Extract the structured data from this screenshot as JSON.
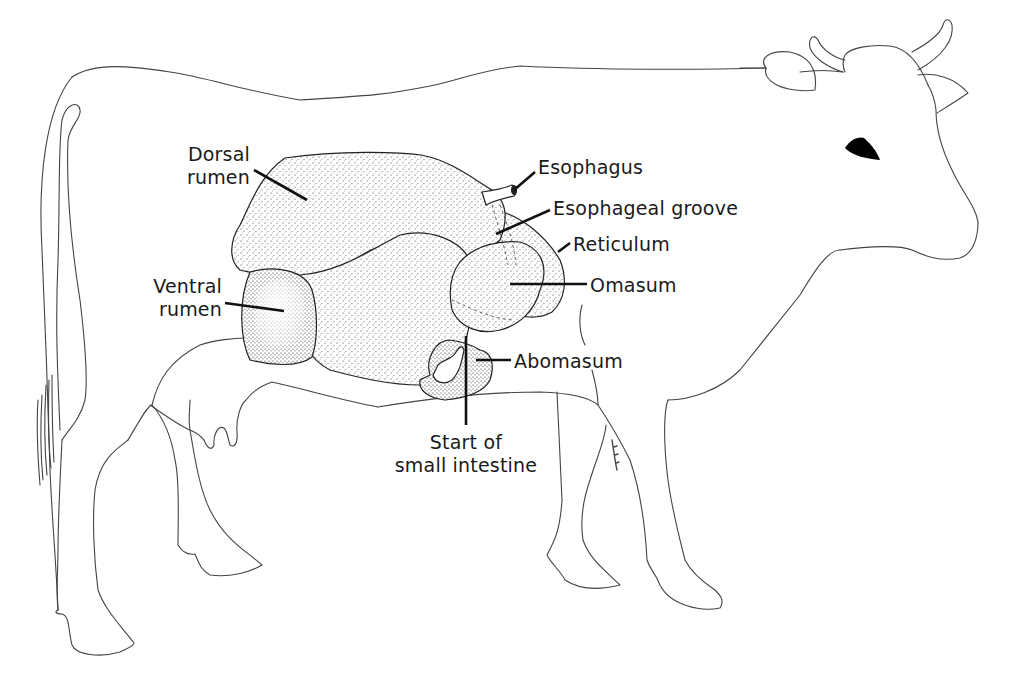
{
  "diagram": {
    "colors": {
      "background": "#ffffff",
      "outline": "#444444",
      "leader_line": "#111111",
      "stipple": "#222222",
      "eye": "#000000"
    },
    "labels": {
      "dorsal_rumen": [
        "Dorsal",
        "rumen"
      ],
      "ventral_rumen": [
        "Ventral",
        "rumen"
      ],
      "esophagus": "Esophagus",
      "esophageal_groove": "Esophageal groove",
      "reticulum": "Reticulum",
      "omasum": "Omasum",
      "abomasum": "Abomasum",
      "start_small_intestine": [
        "Start of",
        "small intestine"
      ]
    }
  }
}
